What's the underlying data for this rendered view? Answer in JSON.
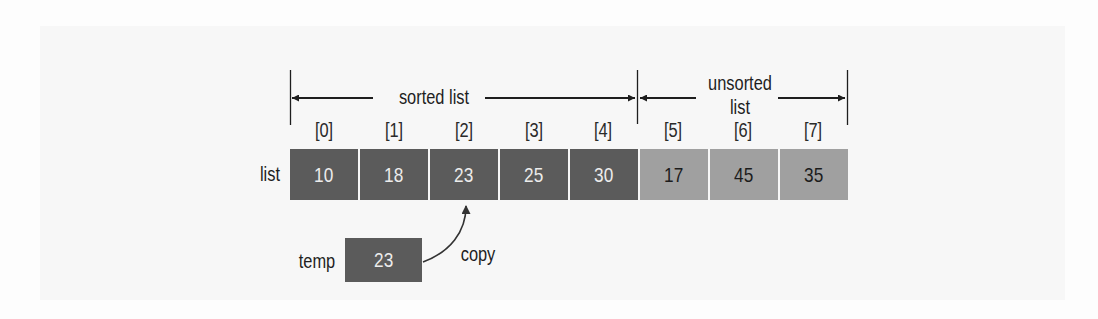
{
  "diagram": {
    "type": "insertion-sort-step",
    "sorted_label": "sorted list",
    "unsorted_label_line1": "unsorted",
    "unsorted_label_line2": "list",
    "array_label": "list",
    "indices": [
      "[0]",
      "[1]",
      "[2]",
      "[3]",
      "[4]",
      "[5]",
      "[6]",
      "[7]"
    ],
    "values": [
      "10",
      "18",
      "23",
      "25",
      "30",
      "17",
      "45",
      "35"
    ],
    "sorted_count": 5,
    "temp_label": "temp",
    "temp_value": "23",
    "copy_label": "copy",
    "copy_target_index": 2,
    "colors": {
      "sorted_cell": "#5b5b5b",
      "sorted_text": "#ececec",
      "unsorted_cell": "#a0a0a0",
      "unsorted_text": "#1c1c1c",
      "line": "#1e1e1e"
    }
  }
}
